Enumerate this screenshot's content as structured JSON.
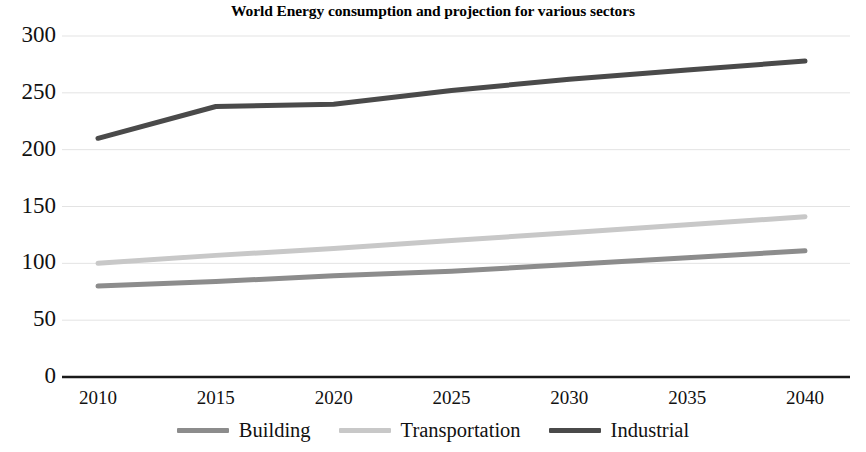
{
  "chart_data": {
    "type": "line",
    "title": "World Energy consumption and projection for various sectors",
    "xlabel": "",
    "ylabel": "",
    "x": [
      2010,
      2015,
      2020,
      2025,
      2030,
      2035,
      2040
    ],
    "categories": [
      "2010",
      "2015",
      "2020",
      "2025",
      "2030",
      "2035",
      "2040"
    ],
    "series": [
      {
        "name": "Building",
        "color": "#8c8c8c",
        "values": [
          80,
          84,
          89,
          93,
          99,
          105,
          111
        ]
      },
      {
        "name": "Transportation",
        "color": "#c8c8c8",
        "values": [
          100,
          107,
          113,
          120,
          127,
          134,
          141
        ]
      },
      {
        "name": "Industrial",
        "color": "#4a4a4a",
        "values": [
          210,
          238,
          240,
          252,
          262,
          270,
          278
        ]
      }
    ],
    "ylim": [
      0,
      300
    ],
    "yticks": [
      0,
      50,
      100,
      150,
      200,
      250,
      300
    ],
    "ytick_labels": [
      "0",
      "50",
      "100",
      "150",
      "200",
      "250",
      "300"
    ],
    "xlim": [
      2010,
      2040
    ],
    "grid": true,
    "grid_axis": "y",
    "legend_position": "bottom"
  },
  "axis": {
    "y_labels": [
      "300",
      "250",
      "200",
      "150",
      "100",
      "50",
      "0"
    ],
    "x_labels": [
      "2010",
      "2015",
      "2020",
      "2025",
      "2030",
      "2035",
      "2040"
    ]
  },
  "legend": {
    "items": [
      {
        "label": "Building",
        "color": "#8c8c8c"
      },
      {
        "label": "Transportation",
        "color": "#c8c8c8"
      },
      {
        "label": "Industrial",
        "color": "#4a4a4a"
      }
    ]
  },
  "colors": {
    "building": "#8c8c8c",
    "transportation": "#c8c8c8",
    "industrial": "#4a4a4a",
    "axis": "#1a1a1a",
    "grid": "#e3e3e3",
    "background": "#ffffff"
  }
}
